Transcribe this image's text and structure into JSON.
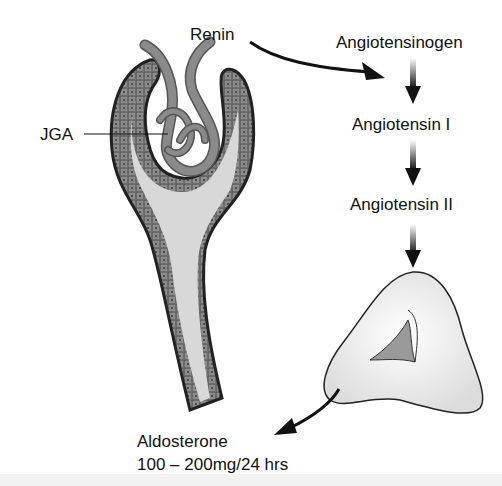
{
  "labels": {
    "renin": "Renin",
    "jga": "JGA",
    "angiotensinogen": "Angiotensinogen",
    "angiotensin_1": "Angiotensin I",
    "angiotensin_2": "Angiotensin II",
    "aldosterone": "Aldosterone",
    "aldosterone_rate": "100 – 200mg/24 hrs"
  },
  "colors": {
    "tubule_cells": "#8a8a8a",
    "lumen": "#d8d8d8",
    "vessel": "#7d7d7d",
    "gland": "#ececec",
    "gland_cavity": "#9a9a9a",
    "outline": "#222222"
  }
}
